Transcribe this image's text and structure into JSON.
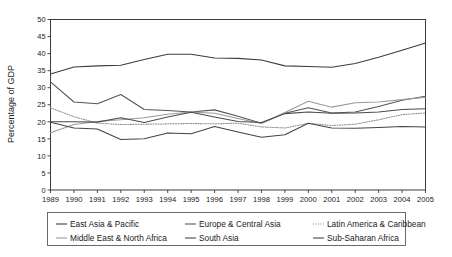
{
  "chart_data": {
    "type": "line",
    "title": "",
    "xlabel": "",
    "ylabel": "Percentage of GDP",
    "xlim": [
      1989,
      2005
    ],
    "ylim": [
      0,
      50
    ],
    "ytick_step": 5,
    "grid": false,
    "legend_position": "bottom",
    "x": [
      1989,
      1990,
      1991,
      1992,
      1993,
      1994,
      1995,
      1996,
      1997,
      1998,
      1999,
      2000,
      2001,
      2002,
      2003,
      2004,
      2005
    ],
    "yticks": [
      "0",
      "5",
      "10",
      "15",
      "20",
      "25",
      "30",
      "35",
      "40",
      "45",
      "50"
    ],
    "xticks": [
      "1989",
      "1990",
      "1991",
      "1992",
      "1993",
      "1994",
      "1995",
      "1996",
      "1997",
      "1998",
      "1999",
      "2000",
      "2001",
      "2002",
      "2003",
      "2004",
      "2005"
    ],
    "series": [
      {
        "name": "East Asia & Pacific",
        "color": "#3c3c3c",
        "dash": "none",
        "values": [
          34.0,
          36.1,
          36.4,
          36.6,
          38.3,
          39.8,
          39.8,
          38.7,
          38.6,
          38.1,
          36.4,
          36.2,
          36.0,
          37.1,
          38.9,
          41.0,
          43.1
        ]
      },
      {
        "name": "Europe & Central Asia",
        "color": "#555555",
        "dash": "none",
        "values": [
          31.7,
          25.8,
          25.3,
          28.0,
          23.6,
          23.3,
          22.9,
          23.5,
          21.6,
          19.6,
          22.5,
          24.1,
          22.6,
          22.9,
          24.5,
          26.3,
          27.5
        ]
      },
      {
        "name": "Latin America & Caribbean",
        "color": "#8c8c8c",
        "dash": "dotted",
        "values": [
          24.1,
          21.5,
          19.6,
          19.2,
          19.3,
          19.4,
          19.5,
          19.4,
          19.6,
          18.5,
          18.2,
          19.6,
          18.9,
          19.3,
          20.6,
          22.1,
          22.6
        ]
      },
      {
        "name": "Middle East & North Africa",
        "color": "#9a9a9a",
        "dash": "none",
        "values": [
          16.8,
          19.2,
          20.1,
          20.6,
          21.2,
          22.2,
          22.9,
          22.5,
          21.0,
          19.5,
          22.7,
          26.0,
          24.3,
          25.6,
          25.8,
          26.5,
          27.2
        ]
      },
      {
        "name": "South Asia",
        "color": "#4a4a4a",
        "dash": "none",
        "values": [
          20.0,
          20.0,
          19.9,
          21.2,
          19.8,
          21.4,
          22.8,
          21.4,
          20.1,
          19.8,
          22.4,
          22.9,
          22.5,
          22.6,
          22.9,
          23.6,
          23.8
        ]
      },
      {
        "name": "Sub-Saharan Africa",
        "color": "#444444",
        "dash": "none",
        "values": [
          19.9,
          18.2,
          17.9,
          14.8,
          15.0,
          16.7,
          16.5,
          18.6,
          17.0,
          15.5,
          16.2,
          19.6,
          18.2,
          18.1,
          18.3,
          18.6,
          18.5
        ]
      }
    ]
  },
  "legend": {
    "entries": [
      {
        "label": "East Asia & Pacific"
      },
      {
        "label": "Europe & Central Asia"
      },
      {
        "label": "Latin America & Caribbean"
      },
      {
        "label": "Middle East & North Africa"
      },
      {
        "label": "South Asia"
      },
      {
        "label": "Sub-Saharan Africa"
      }
    ]
  }
}
